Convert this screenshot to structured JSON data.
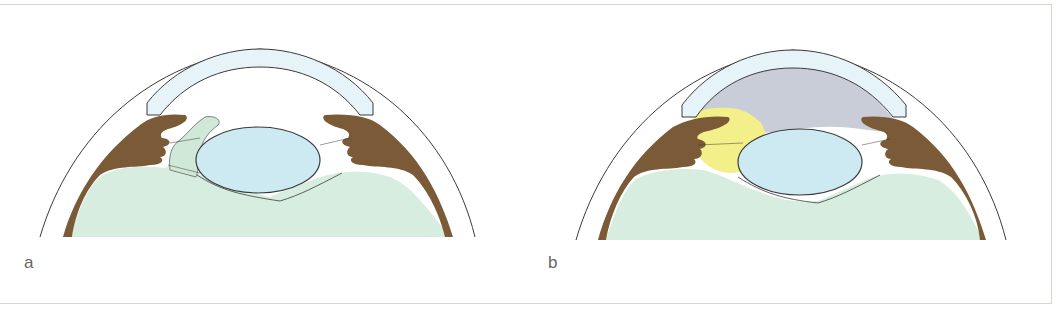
{
  "figure": {
    "panels": [
      {
        "id": "a",
        "label": "a",
        "description": "Eye cross-section: vitreous prolapsing through pupil into anterior chamber"
      },
      {
        "id": "b",
        "label": "b",
        "description": "Eye cross-section: anterior chamber shaded gray with yellow region at iris/pupil"
      }
    ],
    "colors": {
      "cornea": "#e6f3f8",
      "iris_ciliary": "#7a5a37",
      "lens": "#cdeaf2",
      "vitreous": "#d7eddf",
      "anterior_chamber_b": "#c9cdd8",
      "highlight_b": "#f3f08a",
      "outline": "#3b3b3b",
      "frame_border": "#d8d4cc"
    }
  }
}
